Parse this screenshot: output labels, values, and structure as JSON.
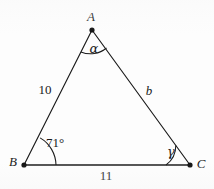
{
  "figure": {
    "type": "geometry-diagram",
    "shape": "triangle",
    "background_color": "#fdfdfd",
    "stroke_color": "#1a1a1a",
    "vertices": [
      {
        "name": "A",
        "label": "A",
        "x": 92,
        "y": 30,
        "label_x": 90,
        "label_y": 14
      },
      {
        "name": "B",
        "label": "B",
        "x": 24,
        "y": 165,
        "label_x": 12,
        "label_y": 157
      },
      {
        "name": "C",
        "label": "C",
        "x": 190,
        "y": 165,
        "label_x": 196,
        "label_y": 159
      }
    ],
    "sides": [
      {
        "name": "side-AB",
        "label": "10",
        "kind": "number",
        "label_x": 38,
        "label_y": 83
      },
      {
        "name": "side-AC",
        "label": "b",
        "kind": "variable",
        "label_x": 143,
        "label_y": 85
      },
      {
        "name": "side-BC",
        "label": "11",
        "kind": "number",
        "label_x": 98,
        "label_y": 170
      }
    ],
    "angles": [
      {
        "name": "angle-A",
        "label": "α",
        "kind": "greek",
        "label_x": 88,
        "label_y": 42,
        "arc_radius": 22
      },
      {
        "name": "angle-B",
        "label": "71°",
        "kind": "degree",
        "label_x": 44,
        "label_y": 137,
        "arc_radius": 30
      },
      {
        "name": "angle-C",
        "label": "γ",
        "kind": "greek",
        "label_x": 166,
        "label_y": 146,
        "arc_radius": 22
      }
    ],
    "measurements": {
      "side_ab_length": "10",
      "side_bc_length": "11",
      "side_ac_length": "b",
      "angle_a": "α",
      "angle_b": "71°",
      "angle_c": "γ"
    }
  }
}
